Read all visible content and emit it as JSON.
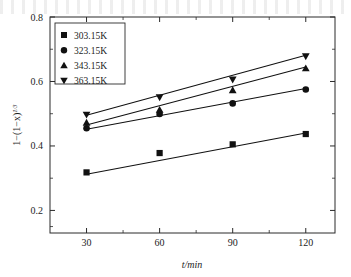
{
  "chart_data": {
    "type": "line",
    "title": "",
    "xlabel": "t/min",
    "ylabel": "1−(1−x)",
    "ylabel_exponent": "1/3",
    "x": [
      30,
      60,
      90,
      120
    ],
    "xlim": [
      15,
      132
    ],
    "ylim": [
      0.13,
      0.8
    ],
    "xticks": [
      30,
      60,
      90,
      120
    ],
    "yticks": [
      0.2,
      0.4,
      0.6,
      0.8
    ],
    "xtick_labels": [
      "30",
      "60",
      "90",
      "120"
    ],
    "ytick_labels": [
      "0.2",
      "0.4",
      "0.6",
      "0.8"
    ],
    "grid": false,
    "legend_position": "upper-left",
    "series": [
      {
        "name": "303.15K",
        "marker": "square",
        "color": "#111111",
        "values": [
          0.318,
          0.378,
          0.405,
          0.437
        ],
        "fit_start": 0.312,
        "fit_end": 0.44
      },
      {
        "name": "323.15K",
        "marker": "circle",
        "color": "#111111",
        "values": [
          0.455,
          0.499,
          0.532,
          0.575
        ],
        "fit_start": 0.452,
        "fit_end": 0.578
      },
      {
        "name": "343.15K",
        "marker": "triangle-up",
        "color": "#111111",
        "values": [
          0.472,
          0.512,
          0.573,
          0.641
        ],
        "fit_start": 0.465,
        "fit_end": 0.645
      },
      {
        "name": "363.15K",
        "marker": "triangle-down",
        "color": "#111111",
        "values": [
          0.497,
          0.551,
          0.606,
          0.678
        ],
        "fit_start": 0.495,
        "fit_end": 0.681
      }
    ]
  },
  "legend": {
    "entries": [
      {
        "label": "303.15K",
        "marker": "square"
      },
      {
        "label": "323.15K",
        "marker": "circle"
      },
      {
        "label": "343.15K",
        "marker": "triangle-up"
      },
      {
        "label": "363.15K",
        "marker": "triangle-down"
      }
    ]
  },
  "axes": {
    "x_title": "t/min",
    "y_title_base": "1−(1−x)",
    "y_title_sup": "1/3"
  }
}
